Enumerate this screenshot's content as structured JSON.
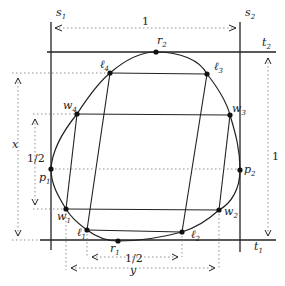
{
  "figure": {
    "type": "geometric-diagram",
    "lines": {
      "s1": {
        "label": "s",
        "sub": "1"
      },
      "s2": {
        "label": "s",
        "sub": "2"
      },
      "t1": {
        "label": "t",
        "sub": "1"
      },
      "t2": {
        "label": "t",
        "sub": "2"
      }
    },
    "points": {
      "r1": {
        "label": "r",
        "sub": "1"
      },
      "r2": {
        "label": "r",
        "sub": "2"
      },
      "p1": {
        "label": "p",
        "sub": "1"
      },
      "p2": {
        "label": "p",
        "sub": "2"
      },
      "l1": {
        "label": "ℓ",
        "sub": "1"
      },
      "l2": {
        "label": "ℓ",
        "sub": "2"
      },
      "l3": {
        "label": "ℓ",
        "sub": "3"
      },
      "l4": {
        "label": "ℓ",
        "sub": "4"
      },
      "w1": {
        "label": "w",
        "sub": "1"
      },
      "w2": {
        "label": "w",
        "sub": "2"
      },
      "w3": {
        "label": "w",
        "sub": "3"
      },
      "w4": {
        "label": "w",
        "sub": "4"
      }
    },
    "dimensions": {
      "top_width": "1",
      "right_height": "1",
      "left_half": "1/2",
      "bottom_half": "1/2",
      "x_label": "x",
      "y_label": "y"
    }
  }
}
